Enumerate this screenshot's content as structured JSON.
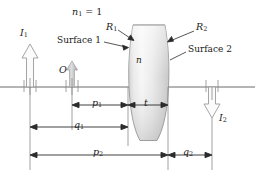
{
  "figure": {
    "type": "optics-ray-diagram",
    "background_color": "#ffffff",
    "ink_color": "#1a1a1a",
    "axis_color": "#555555",
    "lens_fill_light": "#f2f2f2",
    "lens_fill_mid": "#d8d8d8",
    "lens_fill_dark": "#bdbdbd",
    "arrow_gray": "#b8b8b8"
  },
  "labels": {
    "index_outside": "n",
    "index_outside_sub": "1",
    "index_outside_value": " = 1",
    "radius1": "R",
    "radius1_sub": "1",
    "radius2": "R",
    "radius2_sub": "2",
    "surface1": "Surface 1",
    "surface2": "Surface 2",
    "image1": "I",
    "image1_sub": "1",
    "image2": "I",
    "image2_sub": "2",
    "object": "O",
    "index_lens": "n"
  },
  "dimensions": [
    {
      "name": "p1",
      "symbol": "p",
      "sub": "1",
      "from_x": 72,
      "to_x": 128,
      "row_y": 105
    },
    {
      "name": "t",
      "symbol": "t",
      "sub": "",
      "from_x": 128,
      "to_x": 168,
      "row_y": 105
    },
    {
      "name": "q1",
      "symbol": "q",
      "sub": "1",
      "from_x": 30,
      "to_x": 128,
      "row_y": 127
    },
    {
      "name": "p2",
      "symbol": "p",
      "sub": "2",
      "from_x": 30,
      "to_x": 168,
      "row_y": 155
    },
    {
      "name": "q2",
      "symbol": "q",
      "sub": "2",
      "from_x": 168,
      "to_x": 212,
      "row_y": 155
    }
  ],
  "geometry": {
    "axis_y": 87,
    "lens_left_x": 128,
    "lens_right_x": 168,
    "lens_top_y": 25,
    "lens_bottom_y": 141,
    "object_x": 72,
    "image1_x": 30,
    "image2_x": 212
  }
}
